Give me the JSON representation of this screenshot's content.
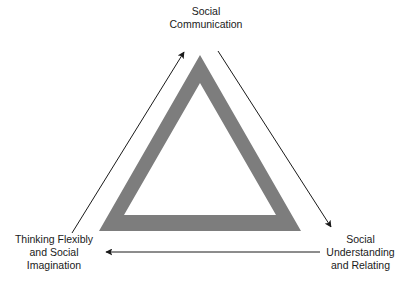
{
  "diagram": {
    "shape": {
      "name": "triangle",
      "fill_color": "#7d7d7d",
      "interior_color": "#ffffff",
      "style": "hollow-band"
    },
    "arrow_color": "#1a1a1a",
    "text_color": "#1a1a1a",
    "nodes": [
      {
        "id": "social-communication",
        "position": "top",
        "lines": [
          "Social",
          "Communication"
        ]
      },
      {
        "id": "thinking-flexibly-and-social-imagination",
        "position": "bottom-left",
        "lines": [
          "Thinking Flexibly",
          "and Social",
          "Imagination"
        ]
      },
      {
        "id": "social-understanding-and-relating",
        "position": "bottom-right",
        "lines": [
          "Social",
          "Understanding",
          "and Relating"
        ]
      }
    ],
    "arrows": [
      {
        "id": "arrow-top-to-bottom-right",
        "from": "social-communication",
        "to": "social-understanding-and-relating",
        "direction": "down-right"
      },
      {
        "id": "arrow-bottom-right-to-bottom-left",
        "from": "social-understanding-and-relating",
        "to": "thinking-flexibly-and-social-imagination",
        "direction": "left"
      },
      {
        "id": "arrow-bottom-left-to-top",
        "from": "thinking-flexibly-and-social-imagination",
        "to": "social-communication",
        "direction": "up-right"
      }
    ]
  }
}
